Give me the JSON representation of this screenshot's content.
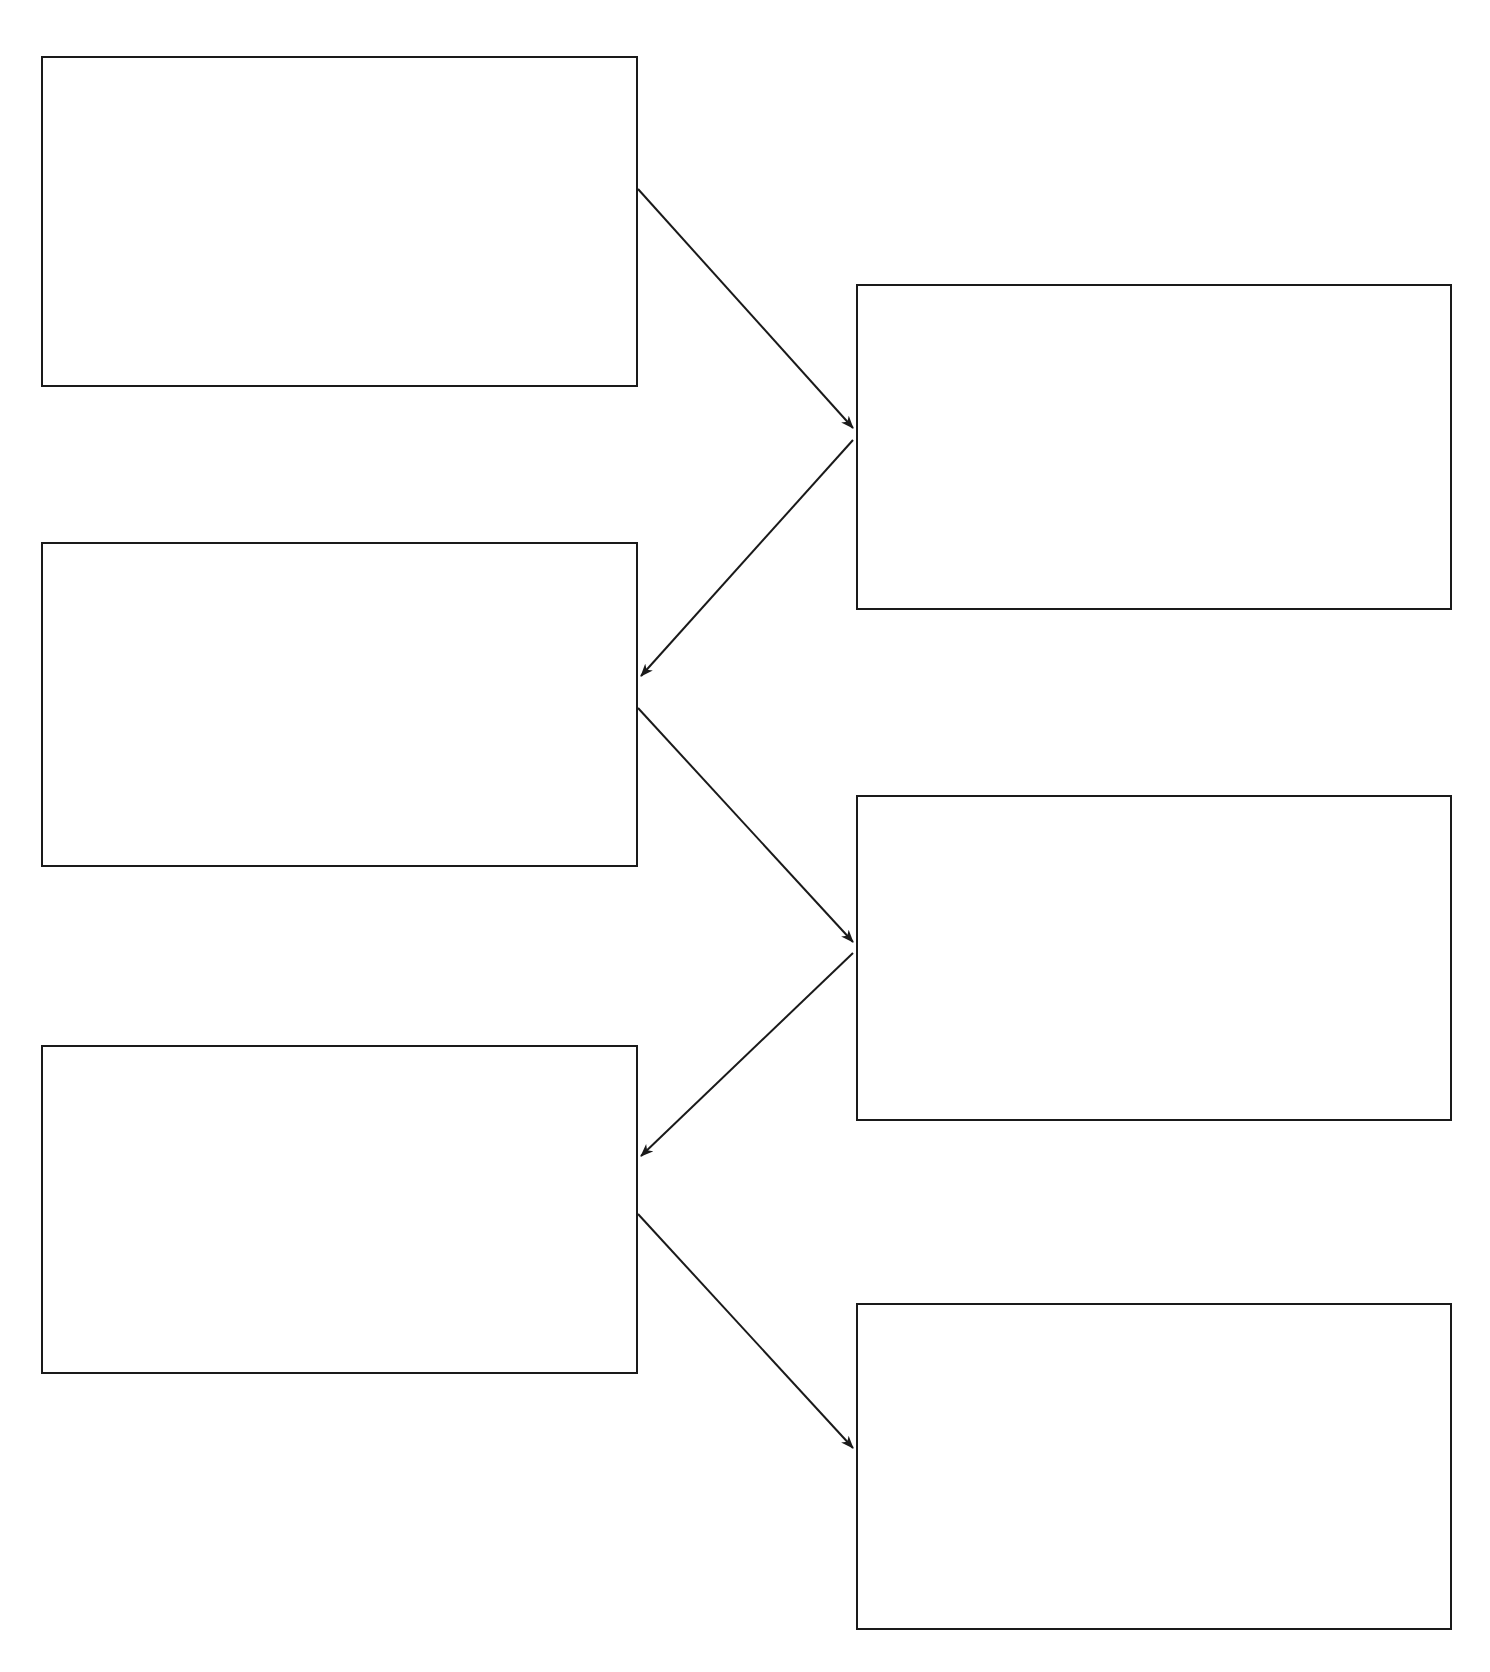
{
  "page": {
    "background_color": "#ffffff",
    "width": 1490,
    "height": 1672
  },
  "style": {
    "box_border_color": "#1a1a1a",
    "box_fill_color": "#ffffff",
    "box_border_width": 2,
    "connector_color": "#1a1a1a",
    "connector_width": 2
  },
  "diagram": {
    "type": "flowchart",
    "orientation": "zigzag-two-column",
    "node_count": 6,
    "connector_count": 5,
    "nodes": [
      {
        "id": "left-box-1",
        "column": "left",
        "order": 1,
        "label": "",
        "x": 41,
        "y": 56,
        "width": 597,
        "height": 331
      },
      {
        "id": "left-box-2",
        "column": "left",
        "order": 2,
        "label": "",
        "x": 41,
        "y": 542,
        "width": 597,
        "height": 325
      },
      {
        "id": "left-box-3",
        "column": "left",
        "order": 3,
        "label": "",
        "x": 41,
        "y": 1045,
        "width": 597,
        "height": 329
      },
      {
        "id": "right-box-1",
        "column": "right",
        "order": 1,
        "label": "",
        "x": 856,
        "y": 284,
        "width": 596,
        "height": 326
      },
      {
        "id": "right-box-2",
        "column": "right",
        "order": 2,
        "label": "",
        "x": 856,
        "y": 795,
        "width": 596,
        "height": 326
      },
      {
        "id": "right-box-3",
        "column": "right",
        "order": 3,
        "label": "",
        "x": 856,
        "y": 1303,
        "width": 596,
        "height": 327
      }
    ],
    "connectors": [
      {
        "id": "connector-1",
        "from": "left-box-1",
        "to": "right-box-1",
        "label": "",
        "arrowhead": "end",
        "x1": 638,
        "y1": 189,
        "x2": 853,
        "y2": 428
      },
      {
        "id": "connector-2",
        "from": "right-box-1",
        "to": "left-box-2",
        "label": "",
        "arrowhead": "end",
        "x1": 853,
        "y1": 440,
        "x2": 641,
        "y2": 676
      },
      {
        "id": "connector-3",
        "from": "left-box-2",
        "to": "right-box-2",
        "label": "",
        "arrowhead": "end",
        "x1": 638,
        "y1": 708,
        "x2": 853,
        "y2": 942
      },
      {
        "id": "connector-4",
        "from": "right-box-2",
        "to": "left-box-3",
        "label": "",
        "arrowhead": "end",
        "x1": 853,
        "y1": 953,
        "x2": 641,
        "y2": 1156
      },
      {
        "id": "connector-5",
        "from": "left-box-3",
        "to": "right-box-3",
        "label": "",
        "arrowhead": "end",
        "x1": 638,
        "y1": 1214,
        "x2": 853,
        "y2": 1448
      }
    ]
  }
}
